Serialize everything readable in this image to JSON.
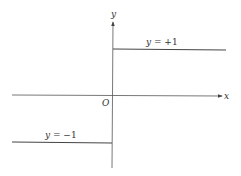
{
  "figure": {
    "title": "",
    "axes": {
      "x_label": "x",
      "y_label": "y",
      "origin_label": "O"
    },
    "pieces": [
      {
        "name": "positive-branch",
        "label_var": "y",
        "label_eq": " = ",
        "label_val": "+1",
        "y_value": 1,
        "x_domain": "x > 0"
      },
      {
        "name": "negative-branch",
        "label_var": "y",
        "label_eq": " = ",
        "label_val": "−1",
        "y_value": -1,
        "x_domain": "x < 0"
      }
    ],
    "colors": {
      "axis": "#555555",
      "line": "#444444",
      "text": "#333333"
    }
  }
}
